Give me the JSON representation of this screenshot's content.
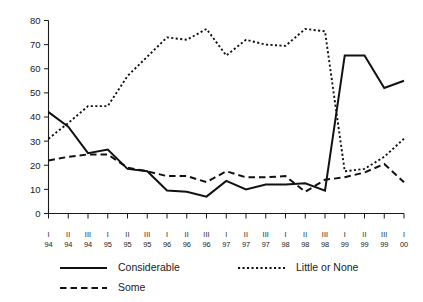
{
  "chart_data": {
    "type": "line",
    "title": "",
    "subtitle": "",
    "xlabel": "",
    "ylabel": "",
    "ylim": [
      0,
      80
    ],
    "yticks": [
      0,
      10,
      20,
      30,
      40,
      50,
      60,
      70,
      80
    ],
    "grid": false,
    "legend_position": "bottom-left",
    "categories": [
      "I 94",
      "II 94",
      "III 94",
      "I 95",
      "II 95",
      "III 95",
      "I 96",
      "II 96",
      "III 96",
      "I 97",
      "II 97",
      "III 97",
      "I 98",
      "II 98",
      "III 98",
      "I 99",
      "II 99",
      "III 99",
      "I 00"
    ],
    "x_quarter_labels": [
      "I",
      "II",
      "III",
      "I",
      "II",
      "III",
      "I",
      "II",
      "III",
      "I",
      "II",
      "III",
      "I",
      "II",
      "III",
      "I",
      "II",
      "III",
      "I"
    ],
    "x_year_labels": [
      "94",
      "94",
      "94",
      "95",
      "95",
      "95",
      "96",
      "96",
      "96",
      "97",
      "97",
      "97",
      "98",
      "98",
      "98",
      "99",
      "99",
      "99",
      "00"
    ],
    "series": [
      {
        "name": "Considerable",
        "style": "solid",
        "values": [
          42,
          36,
          25,
          26.5,
          18.5,
          17.5,
          9.5,
          9,
          7,
          13.5,
          10,
          12,
          12,
          12.5,
          9.5,
          65.5,
          65.5,
          52,
          55
        ]
      },
      {
        "name": "Little or None",
        "style": "dotted",
        "values": [
          31,
          37.5,
          44.5,
          44.5,
          57,
          65,
          73,
          72,
          76.5,
          65.5,
          72,
          70,
          69.5,
          76.5,
          75.5,
          17.5,
          18.5,
          23.5,
          31
        ]
      },
      {
        "name": "Some",
        "style": "dashed",
        "values": [
          22,
          23.5,
          24.5,
          24.5,
          19,
          17.5,
          15.5,
          15.5,
          13,
          17.5,
          15,
          15,
          15.5,
          9,
          14,
          15,
          17,
          20.5,
          13
        ]
      }
    ]
  },
  "legend": {
    "entries": [
      {
        "label": "Considerable",
        "style": "solid"
      },
      {
        "label": "Little or None",
        "style": "dotted"
      },
      {
        "label": "Some",
        "style": "dashed"
      }
    ]
  }
}
